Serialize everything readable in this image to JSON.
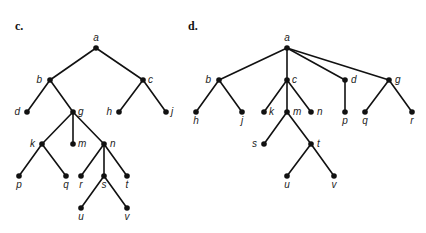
{
  "panels": [
    {
      "id": "c",
      "label": "c.",
      "label_pos": [
        15,
        30
      ],
      "nodes": {
        "a": {
          "x": 96,
          "y": 48,
          "lx": 0,
          "ly": -7,
          "anchor": "middle"
        },
        "b": {
          "x": 50,
          "y": 80,
          "lx": -8,
          "ly": 3,
          "anchor": "end"
        },
        "c": {
          "x": 143,
          "y": 80,
          "lx": 5,
          "ly": 3,
          "anchor": "start"
        },
        "d": {
          "x": 27,
          "y": 112,
          "lx": -7,
          "ly": 3,
          "anchor": "end"
        },
        "g": {
          "x": 73,
          "y": 112,
          "lx": 5,
          "ly": 3,
          "anchor": "start"
        },
        "h": {
          "x": 119,
          "y": 112,
          "lx": -7,
          "ly": 3,
          "anchor": "end"
        },
        "j": {
          "x": 166,
          "y": 112,
          "lx": 5,
          "ly": 3,
          "anchor": "start"
        },
        "k": {
          "x": 42,
          "y": 144,
          "lx": -7,
          "ly": 3,
          "anchor": "end"
        },
        "m": {
          "x": 73,
          "y": 144,
          "lx": 5,
          "ly": 3,
          "anchor": "start"
        },
        "n": {
          "x": 104,
          "y": 144,
          "lx": 6,
          "ly": 3,
          "anchor": "start"
        },
        "p": {
          "x": 19,
          "y": 176,
          "lx": 0,
          "ly": 12,
          "anchor": "middle"
        },
        "q": {
          "x": 66,
          "y": 176,
          "lx": 0,
          "ly": 12,
          "anchor": "middle"
        },
        "r": {
          "x": 81,
          "y": 176,
          "lx": 0,
          "ly": 12,
          "anchor": "middle"
        },
        "s": {
          "x": 104,
          "y": 176,
          "lx": 0,
          "ly": 12,
          "anchor": "middle"
        },
        "t": {
          "x": 127,
          "y": 176,
          "lx": 0,
          "ly": 12,
          "anchor": "middle"
        },
        "u": {
          "x": 81,
          "y": 208,
          "lx": 0,
          "ly": 12,
          "anchor": "middle"
        },
        "v": {
          "x": 127,
          "y": 208,
          "lx": 0,
          "ly": 12,
          "anchor": "middle"
        }
      },
      "edges": [
        [
          "a",
          "b"
        ],
        [
          "a",
          "c"
        ],
        [
          "b",
          "d"
        ],
        [
          "b",
          "g"
        ],
        [
          "c",
          "h"
        ],
        [
          "c",
          "j"
        ],
        [
          "g",
          "k"
        ],
        [
          "g",
          "m"
        ],
        [
          "g",
          "n"
        ],
        [
          "k",
          "p"
        ],
        [
          "k",
          "q"
        ],
        [
          "n",
          "r"
        ],
        [
          "n",
          "s"
        ],
        [
          "n",
          "t"
        ],
        [
          "s",
          "u"
        ],
        [
          "s",
          "v"
        ]
      ]
    },
    {
      "id": "d",
      "label": "d.",
      "label_pos": [
        188,
        30
      ],
      "nodes": {
        "a": {
          "x": 287,
          "y": 48,
          "lx": 0,
          "ly": -7,
          "anchor": "middle"
        },
        "b": {
          "x": 219,
          "y": 80,
          "lx": -8,
          "ly": 3,
          "anchor": "end"
        },
        "c": {
          "x": 287,
          "y": 80,
          "lx": 5,
          "ly": 3,
          "anchor": "start"
        },
        "d": {
          "x": 345,
          "y": 80,
          "lx": 6,
          "ly": 3,
          "anchor": "start"
        },
        "g": {
          "x": 389,
          "y": 80,
          "lx": 6,
          "ly": 3,
          "anchor": "start"
        },
        "h": {
          "x": 196,
          "y": 112,
          "lx": 0,
          "ly": 12,
          "anchor": "middle"
        },
        "j": {
          "x": 242,
          "y": 112,
          "lx": 0,
          "ly": 12,
          "anchor": "middle"
        },
        "k": {
          "x": 264,
          "y": 112,
          "lx": 5,
          "ly": 3,
          "anchor": "start"
        },
        "m": {
          "x": 287,
          "y": 112,
          "lx": 6,
          "ly": 3,
          "anchor": "start"
        },
        "n": {
          "x": 311,
          "y": 112,
          "lx": 6,
          "ly": 3,
          "anchor": "start"
        },
        "p": {
          "x": 345,
          "y": 112,
          "lx": 0,
          "ly": 12,
          "anchor": "middle"
        },
        "q": {
          "x": 365,
          "y": 112,
          "lx": 0,
          "ly": 12,
          "anchor": "middle"
        },
        "r": {
          "x": 412,
          "y": 112,
          "lx": 0,
          "ly": 12,
          "anchor": "middle"
        },
        "s": {
          "x": 264,
          "y": 144,
          "lx": -7,
          "ly": 3,
          "anchor": "end"
        },
        "t": {
          "x": 311,
          "y": 144,
          "lx": 6,
          "ly": 3,
          "anchor": "start"
        },
        "u": {
          "x": 287,
          "y": 176,
          "lx": 0,
          "ly": 12,
          "anchor": "middle"
        },
        "v": {
          "x": 334,
          "y": 176,
          "lx": 0,
          "ly": 12,
          "anchor": "middle"
        }
      },
      "edges": [
        [
          "a",
          "b"
        ],
        [
          "a",
          "c"
        ],
        [
          "a",
          "d"
        ],
        [
          "a",
          "g"
        ],
        [
          "b",
          "h"
        ],
        [
          "b",
          "j"
        ],
        [
          "c",
          "k"
        ],
        [
          "c",
          "m"
        ],
        [
          "c",
          "n"
        ],
        [
          "d",
          "p"
        ],
        [
          "g",
          "q"
        ],
        [
          "g",
          "r"
        ],
        [
          "m",
          "s"
        ],
        [
          "m",
          "t"
        ],
        [
          "t",
          "u"
        ],
        [
          "t",
          "v"
        ]
      ]
    }
  ]
}
